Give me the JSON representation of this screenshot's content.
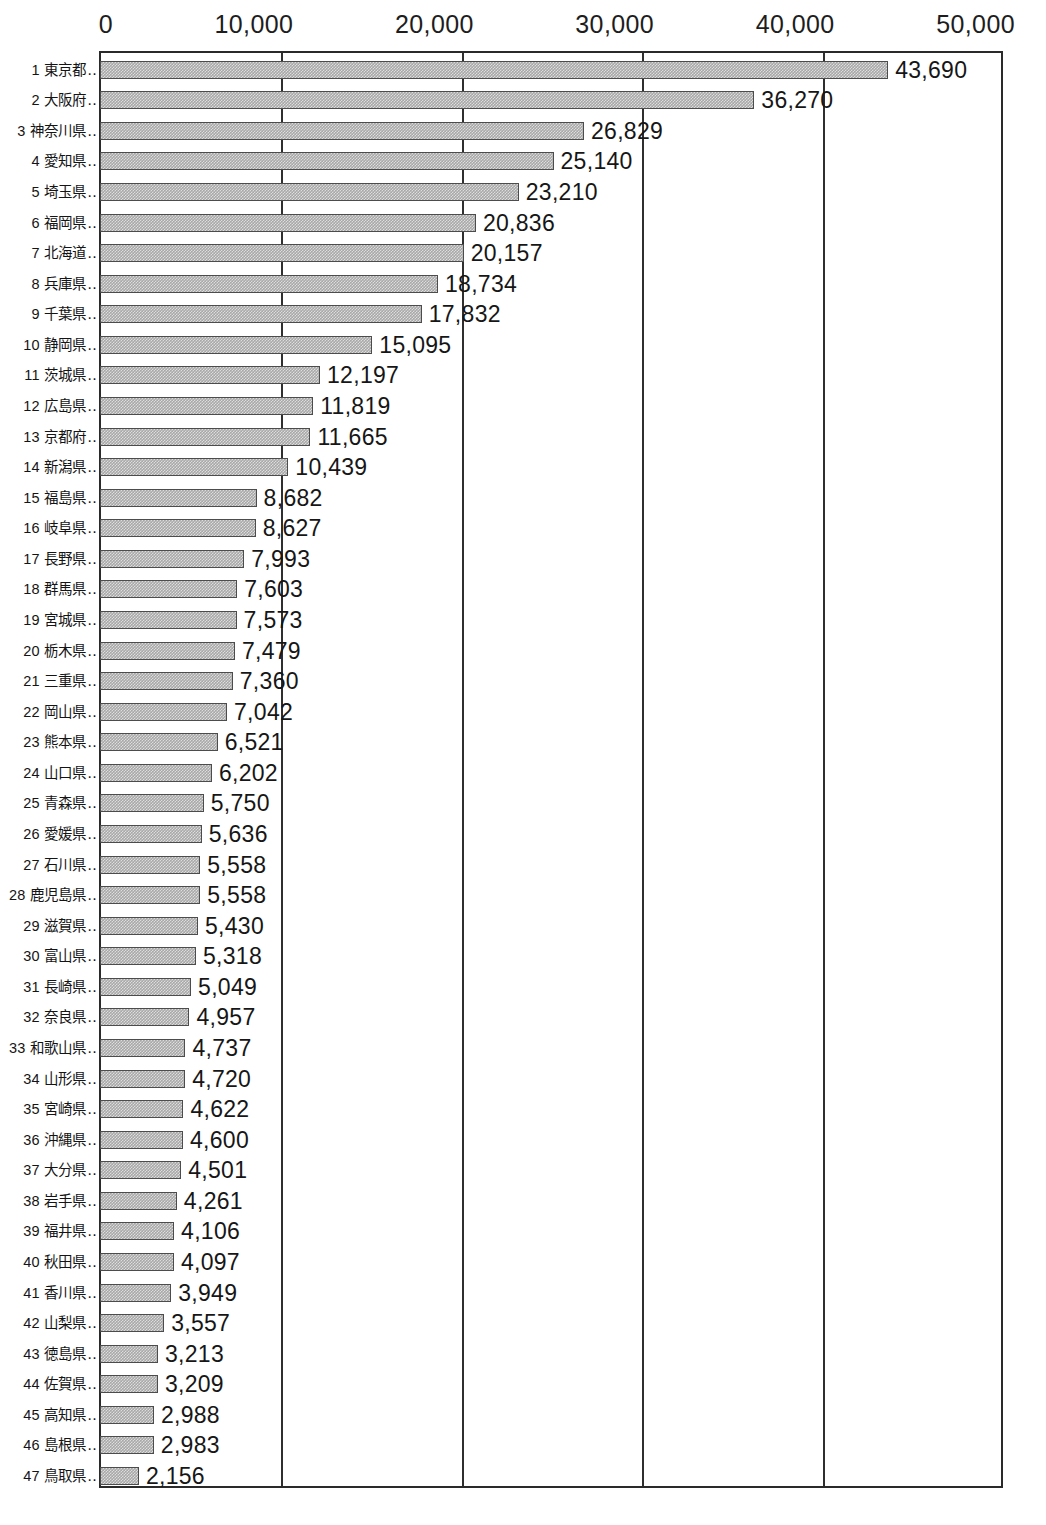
{
  "chart_data": {
    "type": "bar",
    "orientation": "horizontal",
    "title": "",
    "subtitle": "",
    "xlabel": "",
    "ylabel": "",
    "xlim": [
      0,
      50000
    ],
    "grid": true,
    "gridlines_x": [
      0,
      10000,
      20000,
      30000,
      40000,
      50000
    ],
    "legend": null,
    "legend_position": "none",
    "x_tick_labels": [
      "0",
      "10,000",
      "20,000",
      "30,000",
      "40,000",
      "50,000"
    ],
    "x_tick_values": [
      0,
      10000,
      20000,
      30000,
      40000,
      50000
    ],
    "value_label_format": "thousands-comma",
    "bar_fill": "#a8a8a8",
    "bar_border": "#4c4c4c",
    "axis_color": "#2a2a2a",
    "categories": [
      "東京都",
      "大阪府",
      "神奈川県",
      "愛知県",
      "埼玉県",
      "福岡県",
      "北海道",
      "兵庫県",
      "千葉県",
      "静岡県",
      "茨城県",
      "広島県",
      "京都府",
      "新潟県",
      "福島県",
      "岐阜県",
      "長野県",
      "群馬県",
      "宮城県",
      "栃木県",
      "三重県",
      "岡山県",
      "熊本県",
      "山口県",
      "青森県",
      "愛媛県",
      "石川県",
      "鹿児島県",
      "滋賀県",
      "富山県",
      "長崎県",
      "奈良県",
      "和歌山県",
      "山形県",
      "宮崎県",
      "沖縄県",
      "大分県",
      "岩手県",
      "福井県",
      "秋田県",
      "香川県",
      "山梨県",
      "徳島県",
      "佐賀県",
      "高知県",
      "島根県",
      "鳥取県"
    ],
    "ranks": [
      1,
      2,
      3,
      4,
      5,
      6,
      7,
      8,
      9,
      10,
      11,
      12,
      13,
      14,
      15,
      16,
      17,
      18,
      19,
      20,
      21,
      22,
      23,
      24,
      25,
      26,
      27,
      28,
      29,
      30,
      31,
      32,
      33,
      34,
      35,
      36,
      37,
      38,
      39,
      40,
      41,
      42,
      43,
      44,
      45,
      46,
      47
    ],
    "values": [
      43690,
      36270,
      26829,
      25140,
      23210,
      20836,
      20157,
      18734,
      17832,
      15095,
      12197,
      11819,
      11665,
      10439,
      8682,
      8627,
      7993,
      7603,
      7573,
      7479,
      7360,
      7042,
      6521,
      6202,
      5750,
      5636,
      5558,
      5558,
      5430,
      5318,
      5049,
      4957,
      4737,
      4720,
      4622,
      4600,
      4501,
      4261,
      4106,
      4097,
      3949,
      3557,
      3213,
      3209,
      2988,
      2983,
      2156
    ],
    "value_labels": [
      "43,690",
      "36,270",
      "26,829",
      "25,140",
      "23,210",
      "20,836",
      "20,157",
      "18,734",
      "17,832",
      "15,095",
      "12,197",
      "11,819",
      "11,665",
      "10,439",
      "8,682",
      "8,627",
      "7,993",
      "7,603",
      "7,573",
      "7,479",
      "7,360",
      "7,042",
      "6,521",
      "6,202",
      "5,750",
      "5,636",
      "5,558",
      "5,558",
      "5,430",
      "5,318",
      "5,049",
      "4,957",
      "4,737",
      "4,720",
      "4,622",
      "4,600",
      "4,501",
      "4,261",
      "4,106",
      "4,097",
      "3,949",
      "3,557",
      "3,213",
      "3,209",
      "2,988",
      "2,983",
      "2,156"
    ],
    "label_leader": "‥"
  }
}
